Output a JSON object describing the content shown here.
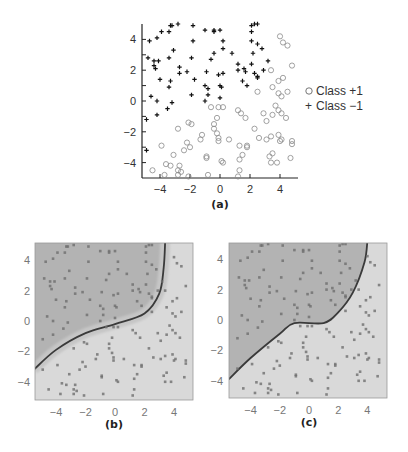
{
  "chart_data": [
    {
      "panel": "(a)",
      "type": "scatter",
      "title": "",
      "xlabel": "",
      "ylabel": "",
      "xlim": [
        -5.2,
        5.2
      ],
      "ylim": [
        -5,
        5
      ],
      "xticks": [
        -4,
        -2,
        0,
        2,
        4
      ],
      "yticks": [
        -4,
        -2,
        0,
        2,
        4
      ],
      "grid": false,
      "legend_position": "right",
      "series": [
        {
          "name": "Class +1",
          "marker": "circle",
          "points": [
            [
              4,
              4.2
            ],
            [
              4.2,
              3.8
            ],
            [
              4.5,
              3.6
            ],
            [
              4.8,
              2.3
            ],
            [
              3.4,
              2.0
            ],
            [
              4.2,
              1.5
            ],
            [
              3.9,
              1.3
            ],
            [
              3.5,
              0.9
            ],
            [
              2.5,
              0.6
            ],
            [
              4.5,
              0.6
            ],
            [
              3.9,
              0.5
            ],
            [
              4.1,
              0.3
            ],
            [
              -0.6,
              -0.4
            ],
            [
              -0.1,
              -0.4
            ],
            [
              0.2,
              -0.4
            ],
            [
              1.2,
              -0.6
            ],
            [
              1.4,
              -0.8
            ],
            [
              1.7,
              -1.1
            ],
            [
              2.9,
              -0.8
            ],
            [
              3.7,
              -0.3
            ],
            [
              3.9,
              -0.6
            ],
            [
              4.1,
              -0.8
            ],
            [
              4.4,
              -1.1
            ],
            [
              3.5,
              -0.9
            ],
            [
              -0.2,
              -1.1
            ],
            [
              -2.1,
              -1.4
            ],
            [
              -1.9,
              -1.5
            ],
            [
              -2.8,
              -1.8
            ],
            [
              -0.4,
              -1.5
            ],
            [
              -0.4,
              -1.8
            ],
            [
              -0.2,
              -2.1
            ],
            [
              2.3,
              -1.8
            ],
            [
              3.1,
              -1.3
            ],
            [
              -1.2,
              -2.2
            ],
            [
              -1.3,
              -2.5
            ],
            [
              -0.1,
              -2.4
            ],
            [
              0.6,
              -2.5
            ],
            [
              -0.1,
              -2.6
            ],
            [
              2.6,
              -2.4
            ],
            [
              3.1,
              -2.5
            ],
            [
              3.4,
              -2.3
            ],
            [
              3.9,
              -2.2
            ],
            [
              4.0,
              -2.6
            ],
            [
              4.1,
              -2.5
            ],
            [
              4.8,
              -2.6
            ],
            [
              4.8,
              -2.8
            ],
            [
              -2.2,
              -2.7
            ],
            [
              -2.0,
              -3.0
            ],
            [
              -2.4,
              -3.2
            ],
            [
              -3.9,
              -2.9
            ],
            [
              1.3,
              -2.9
            ],
            [
              1.8,
              -2.9
            ],
            [
              1.8,
              -3.0
            ],
            [
              -3.1,
              -3.5
            ],
            [
              -0.9,
              -3.6
            ],
            [
              -0.9,
              -3.7
            ],
            [
              1.5,
              -3.5
            ],
            [
              1.3,
              -3.8
            ],
            [
              3.3,
              -3.6
            ],
            [
              3.5,
              -3.4
            ],
            [
              4.7,
              -3.7
            ],
            [
              -3.6,
              -4.1
            ],
            [
              -3.3,
              -4.2
            ],
            [
              -2.7,
              -4.2
            ],
            [
              -2.8,
              -4.5
            ],
            [
              -2.6,
              -4.6
            ],
            [
              0.1,
              -3.9
            ],
            [
              0.2,
              -4.0
            ],
            [
              3.4,
              -4.0
            ],
            [
              3.8,
              -4.0
            ],
            [
              -4.5,
              -4.5
            ],
            [
              -3.7,
              -4.8
            ],
            [
              -2.8,
              -4.8
            ],
            [
              -2.1,
              -4.9
            ],
            [
              -0.8,
              -4.8
            ],
            [
              1.2,
              -4.9
            ],
            [
              1.3,
              -4.5
            ]
          ]
        },
        {
          "name": "Class -1",
          "marker": "plus",
          "points": [
            [
              -4.7,
              3.9
            ],
            [
              -4.2,
              4.1
            ],
            [
              -3.9,
              4.5
            ],
            [
              -3.4,
              4.5
            ],
            [
              -3.3,
              4.9
            ],
            [
              -3.2,
              4.9
            ],
            [
              -2.8,
              5.0
            ],
            [
              -1.8,
              4.9
            ],
            [
              -1.0,
              4.6
            ],
            [
              -0.4,
              4.5
            ],
            [
              -0.4,
              4.6
            ],
            [
              0.0,
              4.6
            ],
            [
              -1.8,
              3.9
            ],
            [
              0.2,
              3.9
            ],
            [
              -3.1,
              3.3
            ],
            [
              -2.7,
              2.2
            ],
            [
              -2.7,
              1.8
            ],
            [
              -2.2,
              1.9
            ],
            [
              -1.9,
              2.8
            ],
            [
              -3.4,
              2.8
            ],
            [
              -4.4,
              2.6
            ],
            [
              -4.1,
              2.6
            ],
            [
              -4.8,
              2.8
            ],
            [
              -4.4,
              2.3
            ],
            [
              -4.3,
              2.1
            ],
            [
              -4.0,
              1.4
            ],
            [
              -3.3,
              1.3
            ],
            [
              -3.4,
              0.9
            ],
            [
              -1.7,
              1.4
            ],
            [
              -0.9,
              1.9
            ],
            [
              -0.6,
              2.7
            ],
            [
              -0.4,
              3.1
            ],
            [
              0.2,
              3.4
            ],
            [
              0.8,
              3.1
            ],
            [
              1.2,
              2.4
            ],
            [
              1.2,
              2.0
            ],
            [
              1.6,
              2.1
            ],
            [
              1.7,
              1.9
            ],
            [
              1.5,
              1.3
            ],
            [
              1.8,
              1.0
            ],
            [
              2.1,
              2.4
            ],
            [
              2.2,
              3.1
            ],
            [
              2.5,
              3.7
            ],
            [
              2.1,
              3.9
            ],
            [
              2.8,
              3.4
            ],
            [
              3.2,
              2.6
            ],
            [
              2.3,
              1.8
            ],
            [
              2.5,
              1.6
            ],
            [
              2.5,
              1.5
            ],
            [
              2.9,
              2.0
            ],
            [
              2.1,
              4.5
            ],
            [
              2.1,
              4.9
            ],
            [
              2.3,
              5.0
            ],
            [
              2.5,
              5.0
            ],
            [
              -1.0,
              1.0
            ],
            [
              -0.8,
              0.8
            ],
            [
              -0.1,
              1.7
            ],
            [
              0.0,
              1.0
            ],
            [
              0.1,
              0.9
            ],
            [
              0.2,
              1.8
            ],
            [
              -0.8,
              0.4
            ],
            [
              -1.0,
              0.0
            ],
            [
              0.0,
              0.2
            ],
            [
              -1.9,
              0.4
            ],
            [
              -4.6,
              0.3
            ],
            [
              -4.2,
              0.0
            ],
            [
              -3.5,
              -0.5
            ],
            [
              -3.2,
              -0.1
            ],
            [
              -4.2,
              -0.9
            ],
            [
              -4.9,
              -1.2
            ],
            [
              -4.9,
              -3.2
            ]
          ]
        }
      ],
      "legend": [
        "Class +1",
        "Class -1"
      ]
    },
    {
      "panel": "(b)",
      "type": "heatmap",
      "title": "",
      "xlim": [
        -5.5,
        5.5
      ],
      "ylim": [
        -5.2,
        5.2
      ],
      "xticks": [
        -4,
        -2,
        0,
        2,
        4
      ],
      "yticks": [
        -4,
        -2,
        0,
        2,
        4
      ],
      "description": "Decision regions with nonlinear boundary; dark region upper-left (Class -1), light region lower-right (Class +1)",
      "boundary": [
        [
          -5.5,
          -3.2
        ],
        [
          -4,
          -1.9
        ],
        [
          -2,
          -0.8
        ],
        [
          0,
          -0.2
        ],
        [
          2,
          0.5
        ],
        [
          3,
          1.8
        ],
        [
          3.3,
          3.5
        ],
        [
          3.4,
          5.2
        ]
      ]
    },
    {
      "panel": "(c)",
      "type": "heatmap",
      "title": "",
      "xlim": [
        -5.5,
        5.5
      ],
      "ylim": [
        -5.2,
        5.2
      ],
      "xticks": [
        -4,
        -2,
        0,
        2,
        4
      ],
      "yticks": [
        -4,
        -2,
        0,
        2,
        4
      ],
      "description": "Decision regions with smoother nonlinear boundary; dark region upper-left, light region lower-right",
      "boundary": [
        [
          -5.5,
          -3.9
        ],
        [
          -4,
          -2.5
        ],
        [
          -2,
          -0.9
        ],
        [
          -1,
          -0.2
        ],
        [
          1,
          -0.2
        ],
        [
          2,
          0.5
        ],
        [
          3,
          1.8
        ],
        [
          3.8,
          3.8
        ],
        [
          4.0,
          5.2
        ]
      ]
    }
  ],
  "labels": {
    "a": "(a)",
    "b": "(b)",
    "c": "(c)",
    "legend_pos": "Class +1",
    "legend_neg": "Class −1",
    "legend_pos_marker": "○",
    "legend_neg_marker": "+"
  },
  "ticks": {
    "x": [
      "−4",
      "−2",
      "0",
      "2",
      "4"
    ],
    "y": [
      "4",
      "2",
      "0",
      "−2",
      "−4"
    ]
  },
  "colors": {
    "dark_region": "#b2b2b2",
    "light_region": "#dadada",
    "boundary": "#3a3a3a",
    "point": "#707070"
  }
}
